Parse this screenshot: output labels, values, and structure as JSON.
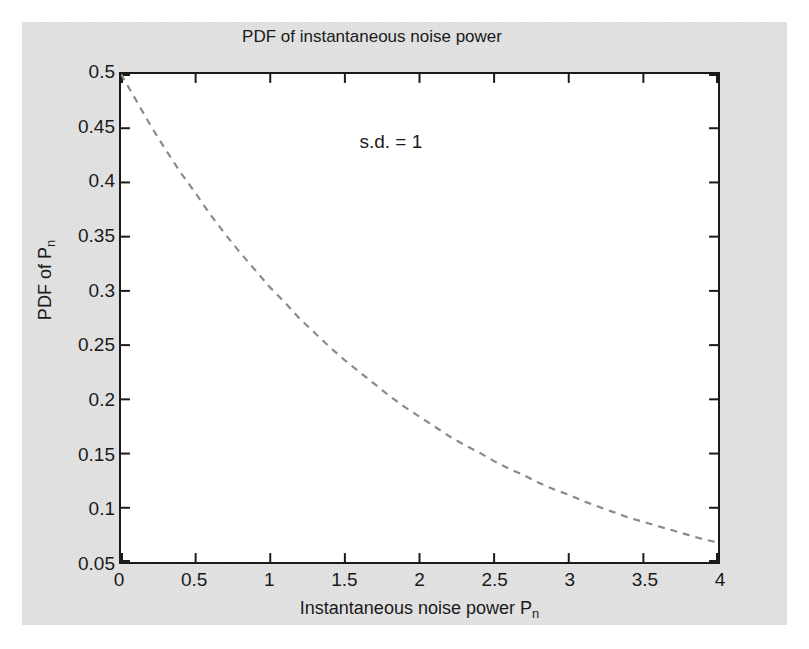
{
  "figure": {
    "background_color": "#e3e3e3",
    "plot_background_color": "#ffffff",
    "axis_color": "#1a1a1a",
    "curve_color": "#8a8a8a",
    "annotation_text": "s.d. = 1",
    "ghost_text_line1": "a c. based a, ran mt. la gr lal.ou",
    "ghost_text_line2": "ing at t se ccont phy te based"
  },
  "chart_data": {
    "type": "line",
    "title": "PDF of instantaneous noise power",
    "xlabel": "Instantaneous noise power P",
    "xlabel_sub": "n",
    "ylabel": "PDF of P",
    "ylabel_sub": "n",
    "xlim": [
      0,
      4
    ],
    "ylim": [
      0.05,
      0.5
    ],
    "grid": false,
    "legend": null,
    "linestyle": "dashed",
    "annotations": [
      {
        "text": "s.d. = 1",
        "x": 1.6,
        "y": 0.435
      }
    ],
    "xticks": [
      0,
      0.5,
      1,
      1.5,
      2,
      2.5,
      3,
      3.5,
      4
    ],
    "xtick_labels": [
      "0",
      "0.5",
      "1",
      "1.5",
      "2",
      "2.5",
      "3",
      "3.5",
      "4"
    ],
    "yticks": [
      0.05,
      0.1,
      0.15,
      0.2,
      0.25,
      0.3,
      0.35,
      0.4,
      0.45,
      0.5
    ],
    "ytick_labels": [
      "0.05",
      "0.1",
      "0.15",
      "0.2",
      "0.25",
      "0.3",
      "0.35",
      "0.4",
      "0.45",
      "0.5"
    ],
    "series": [
      {
        "name": "PDF of Pn (exponential, s.d. = 1)",
        "formula": "0.5*exp(-x/2)",
        "x": [
          0,
          0.1,
          0.2,
          0.3,
          0.4,
          0.5,
          0.6,
          0.7,
          0.8,
          0.9,
          1.0,
          1.1,
          1.2,
          1.3,
          1.4,
          1.5,
          1.6,
          1.7,
          1.8,
          1.9,
          2.0,
          2.1,
          2.2,
          2.3,
          2.4,
          2.5,
          2.6,
          2.7,
          2.8,
          2.9,
          3.0,
          3.1,
          3.2,
          3.3,
          3.4,
          3.5,
          3.6,
          3.7,
          3.8,
          3.9,
          4.0
        ],
        "values": [
          0.5,
          0.476,
          0.452,
          0.43,
          0.409,
          0.39,
          0.37,
          0.352,
          0.335,
          0.319,
          0.303,
          0.289,
          0.274,
          0.261,
          0.248,
          0.236,
          0.225,
          0.214,
          0.203,
          0.193,
          0.184,
          0.175,
          0.166,
          0.158,
          0.151,
          0.143,
          0.136,
          0.13,
          0.123,
          0.117,
          0.112,
          0.106,
          0.101,
          0.096,
          0.091,
          0.087,
          0.083,
          0.079,
          0.075,
          0.071,
          0.068
        ]
      }
    ]
  }
}
